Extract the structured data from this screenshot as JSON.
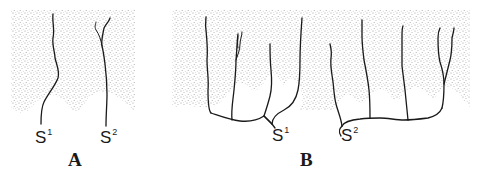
{
  "figure": {
    "panels": [
      {
        "id": "A",
        "label": "A",
        "sources": [
          {
            "name": "S",
            "sup": "1"
          },
          {
            "name": "S",
            "sup": "2"
          }
        ]
      },
      {
        "id": "B",
        "label": "B",
        "sources": [
          {
            "name": "S",
            "sup": "1"
          },
          {
            "name": "S",
            "sup": "2"
          }
        ]
      }
    ],
    "colors": {
      "ink": "#1a1a1a",
      "stipple": "#9a9a9a",
      "background": "#ffffff"
    }
  }
}
